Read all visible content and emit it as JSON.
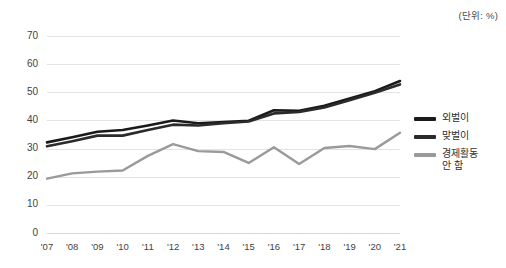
{
  "unit_note": "(단위: %)",
  "legend": {
    "position": "right",
    "items": [
      {
        "label": "외벌이",
        "color": "#1a1a1a"
      },
      {
        "label": "맞벌이",
        "color": "#2b2b2b"
      },
      {
        "label": "경제활동\n안 함",
        "color": "#9a9a9a"
      }
    ]
  },
  "chart_data": {
    "type": "line",
    "title": "",
    "subtitle": "",
    "xlabel": "",
    "ylabel": "",
    "unit": "%",
    "grid": true,
    "legend_position": "right",
    "ylim": [
      0,
      70
    ],
    "yticks": [
      0,
      10,
      20,
      30,
      40,
      50,
      60,
      70
    ],
    "categories": [
      "'07",
      "'08",
      "'09",
      "'10",
      "'11",
      "'12",
      "'13",
      "'14",
      "'15",
      "'16",
      "'17",
      "'18",
      "'19",
      "'20",
      "'21"
    ],
    "series": [
      {
        "name": "외벌이",
        "color": "#1a1a1a",
        "width": 2.6,
        "values": [
          32.2,
          34.0,
          36.0,
          36.6,
          38.2,
          40.0,
          39.0,
          39.4,
          39.9,
          43.6,
          43.4,
          45.2,
          47.8,
          50.4,
          54.0
        ]
      },
      {
        "name": "맞벌이",
        "color": "#2b2b2b",
        "width": 2.6,
        "values": [
          30.8,
          32.6,
          34.6,
          34.6,
          36.6,
          38.5,
          38.2,
          39.0,
          39.6,
          42.5,
          43.0,
          44.6,
          47.2,
          49.8,
          52.8
        ]
      },
      {
        "name": "경제활동 안 함",
        "color": "#9a9a9a",
        "width": 2.4,
        "values": [
          19.3,
          21.2,
          21.8,
          22.2,
          27.4,
          31.6,
          29.1,
          28.8,
          24.9,
          30.5,
          24.5,
          30.2,
          30.9,
          29.8,
          35.6
        ]
      }
    ]
  }
}
